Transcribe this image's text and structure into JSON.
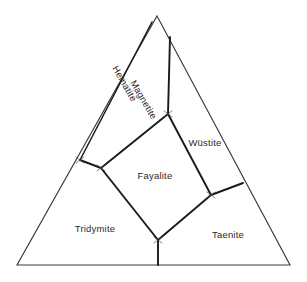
{
  "diagram": {
    "type": "ternary-phase-diagram",
    "title": "",
    "background_color": "#ffffff",
    "outline_color": "#3a3a3a",
    "boundary_color": "#1a1a1a",
    "label_color": "#2b2b2b",
    "triangle": {
      "apex": {
        "x": 157,
        "y": 16
      },
      "bottom_left": {
        "x": 17,
        "y": 265
      },
      "bottom_right": {
        "x": 290,
        "y": 265
      }
    },
    "phase_fields": [
      {
        "id": "hematite",
        "label": "Hematite",
        "x": 124,
        "y": 84,
        "rotation": 60,
        "orientation": "rotated"
      },
      {
        "id": "magnetite",
        "label": "Magnetite",
        "x": 143,
        "y": 100,
        "rotation": 60,
        "orientation": "rotated"
      },
      {
        "id": "wustite",
        "label": "Wüstite",
        "x": 205,
        "y": 143,
        "rotation": 0,
        "orientation": "horizontal"
      },
      {
        "id": "fayalite",
        "label": "Fayalite",
        "x": 155,
        "y": 176,
        "rotation": 0,
        "orientation": "horizontal"
      },
      {
        "id": "tridymite",
        "label": "Tridymite",
        "x": 95,
        "y": 229,
        "rotation": 0,
        "orientation": "horizontal"
      },
      {
        "id": "taenite",
        "label": "Taenite",
        "x": 228,
        "y": 235,
        "rotation": 0,
        "orientation": "horizontal"
      }
    ],
    "boundaries": [
      {
        "id": "hematite-magnetite-boundary",
        "name": "hematite-magnetite",
        "points": "152,22 80,160"
      },
      {
        "id": "magnetite-wustite-boundary",
        "name": "magnetite-wustite",
        "points": "170,37 168,114"
      },
      {
        "id": "magnetite-fayalite-boundary",
        "name": "magnetite-fayalite",
        "points": "168,114 101,168"
      },
      {
        "id": "hematite-edge-tie",
        "name": "hematite-tie-line",
        "points": "80,160 101,168"
      },
      {
        "id": "fayalite-tridymite-boundary",
        "name": "fayalite-tridymite",
        "points": "101,168 158,240"
      },
      {
        "id": "fayalite-wustite-boundary",
        "name": "fayalite-wustite",
        "points": "168,114 211,195"
      },
      {
        "id": "fayalite-taenite-boundary",
        "name": "fayalite-taenite",
        "points": "211,195 158,240"
      },
      {
        "id": "wustite-taenite-boundary",
        "name": "wustite-taenite",
        "points": "211,195 243,183"
      },
      {
        "id": "tridymite-taenite-boundary",
        "name": "tridymite-taenite",
        "points": "158,240 158,265"
      }
    ],
    "nodes": [
      {
        "id": "node-left-edge",
        "x": 80,
        "y": 160
      },
      {
        "id": "node-left-triple",
        "x": 101,
        "y": 168
      },
      {
        "id": "node-upper-triple",
        "x": 168,
        "y": 114
      },
      {
        "id": "node-right-triple",
        "x": 211,
        "y": 195
      },
      {
        "id": "node-bottom-triple",
        "x": 158,
        "y": 240
      }
    ]
  }
}
